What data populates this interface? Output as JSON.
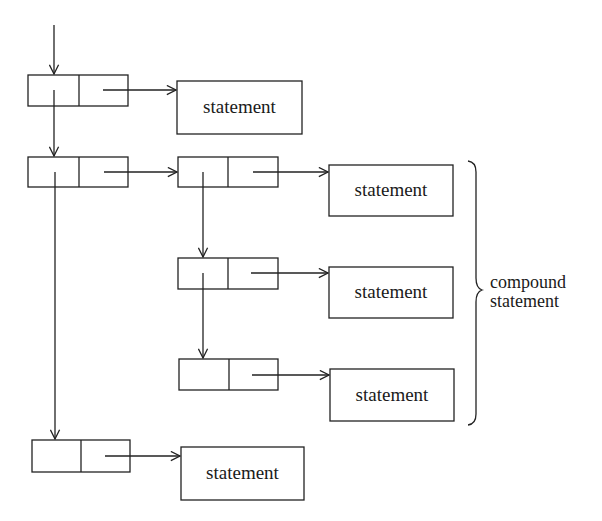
{
  "diagram": {
    "type": "linked-list-statement-tree",
    "statement_label": "statement",
    "brace_label": {
      "line1": "compound",
      "line2": "statement"
    },
    "nodes": [
      {
        "id": "n1",
        "x": 28,
        "y": 75,
        "w": 100,
        "h": 31
      },
      {
        "id": "n2",
        "x": 28,
        "y": 157,
        "w": 100,
        "h": 30
      },
      {
        "id": "n3",
        "x": 178,
        "y": 157,
        "w": 100,
        "h": 30
      },
      {
        "id": "n4",
        "x": 178,
        "y": 258,
        "w": 100,
        "h": 31
      },
      {
        "id": "n5",
        "x": 179,
        "y": 359,
        "w": 99,
        "h": 31
      },
      {
        "id": "n6",
        "x": 32,
        "y": 440,
        "w": 98,
        "h": 32
      }
    ],
    "statements": [
      {
        "id": "s1",
        "label": "statement",
        "x": 177,
        "y": 81,
        "w": 125,
        "h": 53
      },
      {
        "id": "s2",
        "label": "statement",
        "x": 329,
        "y": 165,
        "w": 124,
        "h": 51
      },
      {
        "id": "s3",
        "label": "statement",
        "x": 329,
        "y": 267,
        "w": 124,
        "h": 51
      },
      {
        "id": "s4",
        "label": "statement",
        "x": 330,
        "y": 369,
        "w": 124,
        "h": 52
      },
      {
        "id": "s5",
        "label": "statement",
        "x": 181,
        "y": 447,
        "w": 123,
        "h": 53
      }
    ]
  }
}
